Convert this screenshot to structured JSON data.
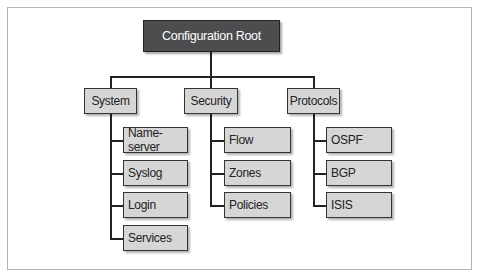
{
  "root": {
    "label": "Configuration Root"
  },
  "branches": [
    {
      "label": "System",
      "children": [
        "Name-server",
        "Syslog",
        "Login",
        "Services"
      ]
    },
    {
      "label": "Security",
      "children": [
        "Flow",
        "Zones",
        "Policies"
      ]
    },
    {
      "label": "Protocols",
      "children": [
        "OSPF",
        "BGP",
        "ISIS"
      ]
    }
  ],
  "colors": {
    "root_fill": "#4d4d4f",
    "node_fill": "#d6d6d6",
    "border": "#333333"
  }
}
